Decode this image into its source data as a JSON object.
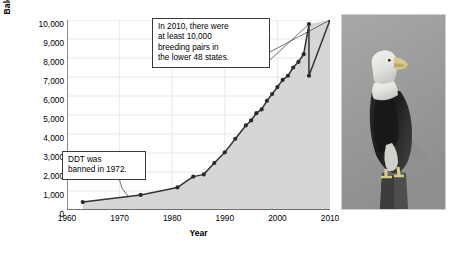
{
  "chart_data": {
    "type": "area",
    "title": "",
    "xlabel": "Year",
    "ylabel": "Bald eagle pairs",
    "xlim": [
      1960,
      2010
    ],
    "ylim": [
      0,
      10000
    ],
    "grid": true,
    "legend_position": "none",
    "xticks": [
      "1960",
      "1970",
      "1980",
      "1990",
      "2000",
      "2010"
    ],
    "xtick_values": [
      1960,
      1970,
      1980,
      1990,
      2000,
      2010
    ],
    "yticks": [
      "0",
      "1,000",
      "2,000",
      "3,000",
      "4,000",
      "5,000",
      "6,000",
      "7,000",
      "8,000",
      "9,000",
      "10,000"
    ],
    "ytick_values": [
      0,
      1000,
      2000,
      3000,
      4000,
      5000,
      6000,
      7000,
      8000,
      9000,
      10000
    ],
    "series": [
      {
        "name": "Bald eagle breeding pairs",
        "marker": "circle",
        "line_color": "#333333",
        "fill_color": "#cfcfcf",
        "x": [
          1963,
          1974,
          1981,
          1984,
          1986,
          1988,
          1990,
          1992,
          1994,
          1995,
          1996,
          1997,
          1998,
          1999,
          2000,
          2001,
          2002,
          2003,
          2004,
          2005,
          2006,
          2006,
          2010
        ],
        "values": [
          417,
          791,
          1188,
          1757,
          1875,
          2475,
          3035,
          3749,
          4449,
          4712,
          5094,
          5295,
          5748,
          6104,
          6471,
          6846,
          7066,
          7500,
          7800,
          8200,
          9789,
          7066,
          10000
        ]
      }
    ],
    "annotations": [
      {
        "name": "callout-2010",
        "lines": [
          "In 2010, there were",
          "at least 10,000",
          "breeding pairs in",
          "the lower 48 states."
        ],
        "points_to": [
          2010,
          10000
        ]
      },
      {
        "name": "callout-ddt",
        "lines": [
          "DDT was",
          "banned in 1972."
        ],
        "points_to": [
          1972,
          700
        ]
      }
    ]
  },
  "photo": {
    "name": "bald-eagle-photo",
    "alt": "Bald eagle perched on a wooden post",
    "background_color": "#9e9e9e"
  }
}
